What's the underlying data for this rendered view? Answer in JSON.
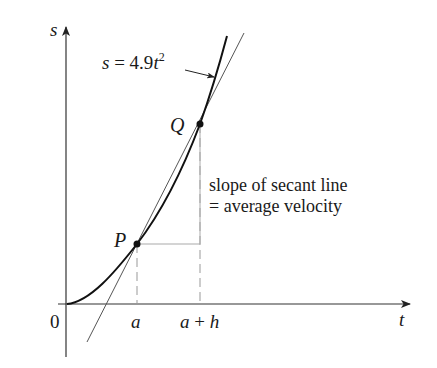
{
  "figure": {
    "axes": {
      "y_label": "s",
      "x_label": "t",
      "origin_label": "0"
    },
    "curve": {
      "equation_prefix": "s = 4.9",
      "equation_var": "t",
      "equation_exp": "2"
    },
    "points": {
      "p_label": "P",
      "q_label": "Q"
    },
    "ticks": {
      "a_label": "a",
      "a_plus_h_label_a": "a",
      "a_plus_h_label_plus": " + ",
      "a_plus_h_label_h": "h"
    },
    "annotation": {
      "line1": "slope of secant line",
      "line2": "= average velocity"
    },
    "colors": {
      "axis": "#333333",
      "curve": "#111111",
      "secant": "#555555",
      "guide": "#999999"
    }
  }
}
